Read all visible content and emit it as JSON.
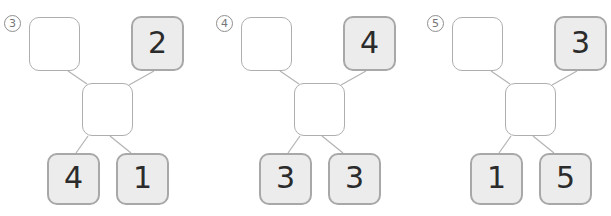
{
  "styles": {
    "filled_box_bg": "#ececec",
    "filled_box_border": "#a8a8a8",
    "empty_box_bg": "#ffffff",
    "empty_box_border": "#aeaeae",
    "line_color": "#b5b5b5",
    "number_color": "#2b2b2b",
    "label_color": "#757575",
    "page_bg": "#ffffff"
  },
  "diagrams": [
    {
      "label": "3",
      "top_left": "",
      "top_right": "2",
      "middle": "",
      "bottom_left": "4",
      "bottom_right": "1"
    },
    {
      "label": "4",
      "top_left": "",
      "top_right": "4",
      "middle": "",
      "bottom_left": "3",
      "bottom_right": "3"
    },
    {
      "label": "5",
      "top_left": "",
      "top_right": "3",
      "middle": "",
      "bottom_left": "1",
      "bottom_right": "5"
    }
  ]
}
